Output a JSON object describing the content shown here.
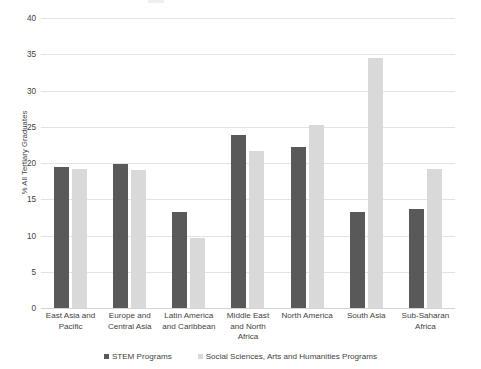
{
  "chart_data": {
    "type": "bar",
    "title": "",
    "subtitle": "",
    "xlabel": "",
    "ylabel": "% All Tertiary Graduates",
    "ylim": [
      0,
      40
    ],
    "ytick_step": 5,
    "yticks": [
      0,
      5,
      10,
      15,
      20,
      25,
      30,
      35,
      40
    ],
    "ytick_labels": [
      "0",
      "5",
      "10",
      "15",
      "20",
      "25",
      "30",
      "35",
      "40"
    ],
    "grid": true,
    "legend_position": "bottom",
    "categories": [
      "East Asia and Pacific",
      "Europe and Central Asia",
      "Latin America and Caribbean",
      "Middle East and North Africa",
      "North America",
      "South Asia",
      "Sub-Saharan Africa"
    ],
    "category_lines": [
      [
        "East Asia and",
        "Pacific"
      ],
      [
        "Europe and",
        "Central Asia"
      ],
      [
        "Latin America",
        "and Caribbean"
      ],
      [
        "Middle East",
        "and North",
        "Africa"
      ],
      [
        "North America"
      ],
      [
        "South Asia"
      ],
      [
        "Sub-Saharan",
        "Africa"
      ]
    ],
    "series": [
      {
        "name": "STEM Programs",
        "color": "#595959",
        "values": [
          19.5,
          19.9,
          13.2,
          23.8,
          22.2,
          13.2,
          13.7
        ]
      },
      {
        "name": "Social Sciences, Arts and Humanities Programs",
        "color": "#d9d9d9",
        "values": [
          19.2,
          19.0,
          9.7,
          21.6,
          25.3,
          34.5,
          19.2
        ]
      }
    ]
  },
  "legend": {
    "items": [
      {
        "label": "STEM Programs",
        "swatch": "stem"
      },
      {
        "label": "Social Sciences, Arts and Humanities Programs",
        "swatch": "ssah"
      }
    ]
  },
  "colors": {
    "stem": "#595959",
    "ssah": "#d9d9d9",
    "gridline": "#e3e3e3",
    "text": "#3f3f3f",
    "background": "#ffffff"
  }
}
